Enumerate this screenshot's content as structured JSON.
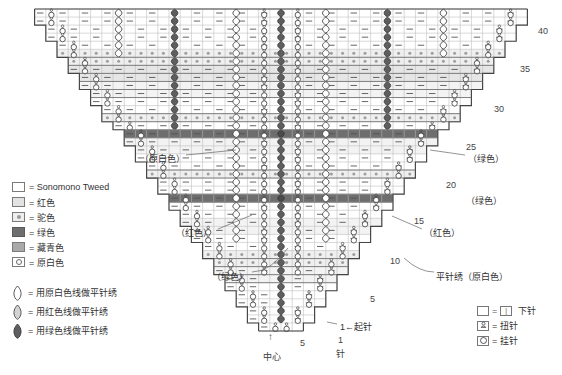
{
  "legend_colors": {
    "heading": "",
    "items": [
      {
        "swatch": "white",
        "symbol": "empty-square",
        "label": "= Sonomono Tweed",
        "color": "#ffffff"
      },
      {
        "swatch": "red",
        "symbol": "light-gray-square",
        "label": "= 红色",
        "color": "#e2e2e2"
      },
      {
        "swatch": "camel",
        "symbol": "dotted-square",
        "label": "= 驼色",
        "color": "#eeeeee"
      },
      {
        "swatch": "green",
        "symbol": "dark-gray-square",
        "label": "= 绿色",
        "color": "#6e6e6e"
      },
      {
        "swatch": "navy",
        "symbol": "mid-gray-square",
        "label": "= 藏青色",
        "color": "#a9a9a9"
      },
      {
        "swatch": "natural",
        "symbol": "circle-square",
        "label": "= 原白色",
        "color": "#ffffff"
      }
    ]
  },
  "legend_embroidery": {
    "items": [
      {
        "glyph": "bean-outline",
        "label": "= 用原白色线做平针绣",
        "fill": "#ffffff"
      },
      {
        "glyph": "bean-light",
        "label": "= 用红色线做平针绣",
        "fill": "#d9d9d9"
      },
      {
        "glyph": "bean-dark",
        "label": "= 用绿色线做平针绣",
        "fill": "#5e5e5e"
      }
    ]
  },
  "legend_stitches": {
    "items": [
      {
        "box": "empty",
        "inner": "",
        "eq2": "=",
        "inner2": "|",
        "label": "下针"
      },
      {
        "box": "twist",
        "inner": "ʘ",
        "label": "= 扭针"
      },
      {
        "box": "yo",
        "inner": "O",
        "label": "= 挂针"
      }
    ]
  },
  "annotations": [
    {
      "name": "natural-white-left",
      "text": "（原白色）",
      "x": 140,
      "y": 152
    },
    {
      "name": "green-right",
      "text": "（绿色）",
      "x": 468,
      "y": 152
    },
    {
      "name": "red-left",
      "text": "（红色）",
      "x": 176,
      "y": 226
    },
    {
      "name": "red-right",
      "text": "（红色）",
      "x": 424,
      "y": 226
    },
    {
      "name": "green-left",
      "text": "（绿色）",
      "x": 212,
      "y": 270
    },
    {
      "name": "satin-stitch-right",
      "text": "平针绣（原白色）",
      "x": 436,
      "y": 270
    },
    {
      "name": "green-mid-right",
      "text": "（绿色）",
      "x": 466,
      "y": 194
    },
    {
      "name": "cast-on",
      "text": "1←起针",
      "x": 340,
      "y": 324
    }
  ],
  "row_numbers": [
    {
      "value": "40",
      "x": 538,
      "y": 26
    },
    {
      "value": "35",
      "x": 520,
      "y": 64
    },
    {
      "value": "30",
      "x": 494,
      "y": 104
    },
    {
      "value": "25",
      "x": 466,
      "y": 142
    },
    {
      "value": "20",
      "x": 446,
      "y": 180
    },
    {
      "value": "15",
      "x": 414,
      "y": 216
    },
    {
      "value": "10",
      "x": 390,
      "y": 256
    },
    {
      "value": "5",
      "x": 370,
      "y": 294
    }
  ],
  "axis_labels": [
    {
      "value": "5",
      "x": 300,
      "y": 338
    },
    {
      "value": "1",
      "x": 338,
      "y": 336
    },
    {
      "value": "针",
      "x": 336,
      "y": 347
    }
  ],
  "center": {
    "arrow": "↑",
    "label": "中心"
  },
  "chart_data": {
    "type": "table",
    "rows": 40,
    "max_stitches_half": 22,
    "note": "Symmetric triangle; stitch count increases 2 per row each side from center.",
    "color_bands": [
      {
        "rows": "1-3",
        "color": "white"
      },
      {
        "rows": "4-5",
        "color": "red"
      },
      {
        "rows": "6-7",
        "color": "camel"
      },
      {
        "rows": "8-12",
        "color": "white"
      },
      {
        "rows": "13",
        "color": "green"
      },
      {
        "rows": "14-19",
        "color": "white"
      },
      {
        "rows": "20",
        "color": "navy"
      },
      {
        "rows": "21",
        "color": "camel"
      },
      {
        "rows": "22-27",
        "color": "white"
      },
      {
        "rows": "28-29",
        "color": "red"
      },
      {
        "rows": "30-31",
        "color": "camel"
      },
      {
        "rows": "32-34",
        "color": "white"
      },
      {
        "rows": "35-40",
        "color": "white"
      }
    ]
  }
}
